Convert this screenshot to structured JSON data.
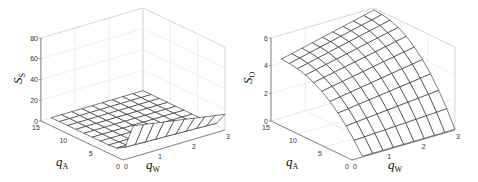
{
  "chart_data": [
    {
      "type": "surface",
      "title": "",
      "zlabel": "S_S",
      "xlabel": "q_W",
      "ylabel": "q_A",
      "zlim": [
        0,
        80
      ],
      "xlim": [
        0,
        3
      ],
      "ylim": [
        0,
        15
      ],
      "z_ticks": [
        "0",
        "20",
        "40",
        "60",
        "80"
      ],
      "x_ticks": [
        "0",
        "1",
        "2",
        "3"
      ],
      "y_ticks": [
        "0",
        "5",
        "10",
        "15"
      ],
      "grid": true,
      "qW": [
        0.3,
        0.6,
        0.9,
        1.2,
        1.5,
        1.8,
        2.1,
        2.4,
        2.7,
        3.0
      ],
      "qA": [
        0,
        1.5,
        3,
        4.5,
        6,
        7.5,
        9,
        10.5,
        12,
        13.5,
        15
      ],
      "surface_description": "Near zero over most of the domain; sharp ridge along q_A=0 edge, about 30 at q_W=0.3 decaying to about 15 at q_W=3"
    },
    {
      "type": "surface",
      "title": "",
      "zlabel": "S_O",
      "xlabel": "q_W",
      "ylabel": "q_A",
      "zlim": [
        0,
        6
      ],
      "xlim": [
        0,
        3
      ],
      "ylim": [
        0,
        15
      ],
      "z_ticks": [
        "0",
        "2",
        "4",
        "6"
      ],
      "x_ticks": [
        "0",
        "1",
        "2",
        "3"
      ],
      "y_ticks": [
        "0",
        "5",
        "10",
        "15"
      ],
      "grid": true,
      "qW": [
        0.3,
        0.6,
        0.9,
        1.2,
        1.5,
        1.8,
        2.1,
        2.4,
        2.7,
        3.0
      ],
      "qA": [
        0,
        1.5,
        3,
        4.5,
        6,
        7.5,
        9,
        10.5,
        12,
        13.5,
        15
      ],
      "surface_description": "Near zero at q_A=0, rising concavely with q_A to about 4.2 at q_A=15 (q_W=0.3) and about 5.8 at q_A=15 (q_W=3)"
    }
  ],
  "plots": [
    {
      "zlabel_main": "S",
      "zlabel_sub": "S",
      "xlabel_main": "q",
      "xlabel_sub": "W",
      "ylabel_main": "q",
      "ylabel_sub": "A"
    },
    {
      "zlabel_main": "S",
      "zlabel_sub": "O",
      "xlabel_main": "q",
      "xlabel_sub": "W",
      "ylabel_main": "q",
      "ylabel_sub": "A"
    }
  ]
}
